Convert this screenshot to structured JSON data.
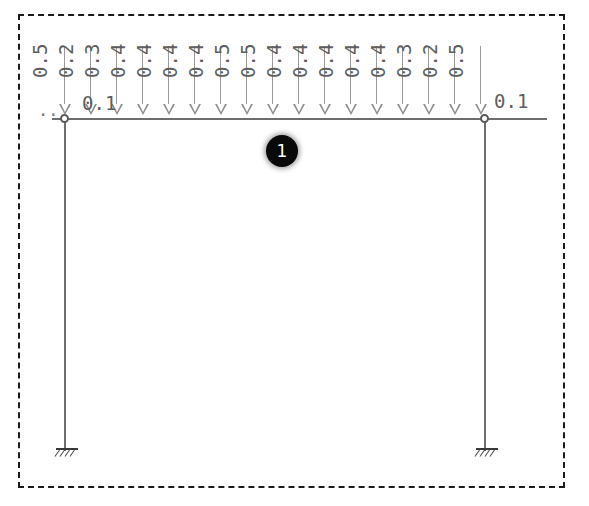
{
  "diagram": {
    "member_badge": "1",
    "frame": {
      "border_style": "dashed",
      "border_color": "#1b1b1b"
    },
    "beam": {
      "color": "#6e6e6e",
      "left_node_x": 64,
      "right_node_x": 484,
      "y": 118
    },
    "left_end_label": "0.1",
    "right_end_label": "0.1",
    "leader_dots": "..",
    "loads": [
      {
        "value": "0.5",
        "x": 64
      },
      {
        "value": "0.2",
        "x": 90
      },
      {
        "value": "0.3",
        "x": 116
      },
      {
        "value": "0.4",
        "x": 142
      },
      {
        "value": "0.4",
        "x": 168
      },
      {
        "value": "0.4",
        "x": 194
      },
      {
        "value": "0.4",
        "x": 220
      },
      {
        "value": "0.5",
        "x": 246
      },
      {
        "value": "0.5",
        "x": 272
      },
      {
        "value": "0.4",
        "x": 298
      },
      {
        "value": "0.4",
        "x": 324
      },
      {
        "value": "0.4",
        "x": 350
      },
      {
        "value": "0.4",
        "x": 376
      },
      {
        "value": "0.4",
        "x": 402
      },
      {
        "value": "0.3",
        "x": 428
      },
      {
        "value": "0.2",
        "x": 454
      },
      {
        "value": "0.5",
        "x": 480
      }
    ],
    "supports": [
      {
        "name": "left-fixed-support",
        "x": 64,
        "y": 440
      },
      {
        "name": "right-fixed-support",
        "x": 484,
        "y": 440
      }
    ],
    "colors": {
      "member": "#6e6e6e",
      "load": "#8f8f8f",
      "label": "#5e5e5e",
      "badge_bg": "#0a0a0a",
      "badge_text": "#ffffff",
      "border": "#1b1b1b"
    }
  }
}
